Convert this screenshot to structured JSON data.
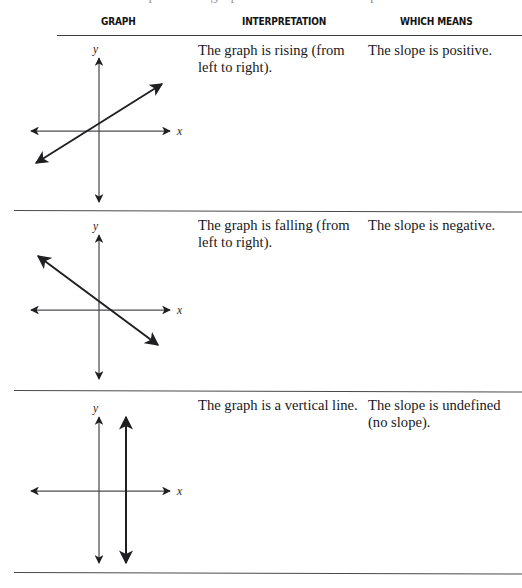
{
  "page": {
    "cut_off_top_line": "s slope on the graph of a line and its slope",
    "background_color": "#ffffff",
    "rule_color": "#4a4a4d",
    "ink_color": "#1f1f22"
  },
  "table": {
    "headers": [
      {
        "id": "graph",
        "label": "GRAPH"
      },
      {
        "id": "interpretation",
        "label": "INTERPRETATION"
      },
      {
        "id": "which_means",
        "label": "WHICH MEANS"
      }
    ],
    "rows": [
      {
        "id": "positive-slope",
        "graph": {
          "kind": "rising-line",
          "x_axis_label": "x",
          "y_axis_label": "y",
          "line_description": "line rising from lower left to upper right"
        },
        "interpretation": "The graph is rising (from left to right).",
        "which_means": "The slope is positive."
      },
      {
        "id": "negative-slope",
        "graph": {
          "kind": "falling-line",
          "x_axis_label": "x",
          "y_axis_label": "y",
          "line_description": "line falling from upper left to lower right"
        },
        "interpretation": "The graph is falling (from left to right).",
        "which_means": "The slope is negative."
      },
      {
        "id": "undefined-slope",
        "graph": {
          "kind": "vertical-line",
          "x_axis_label": "x",
          "y_axis_label": "y",
          "line_description": "vertical line to the right of the y-axis"
        },
        "interpretation": "The graph is a vertical line.",
        "which_means": "The slope is undefined (no slope)."
      }
    ]
  }
}
